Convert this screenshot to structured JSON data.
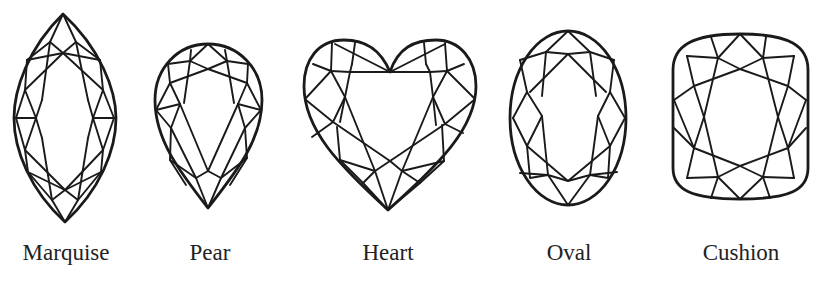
{
  "diagram": {
    "title": "",
    "stroke_color": "#1a1a1a",
    "background": "#ffffff",
    "shapes": [
      {
        "id": "marquise",
        "label": "Marquise"
      },
      {
        "id": "pear",
        "label": "Pear"
      },
      {
        "id": "heart",
        "label": "Heart"
      },
      {
        "id": "oval",
        "label": "Oval"
      },
      {
        "id": "cushion",
        "label": "Cushion"
      }
    ]
  }
}
